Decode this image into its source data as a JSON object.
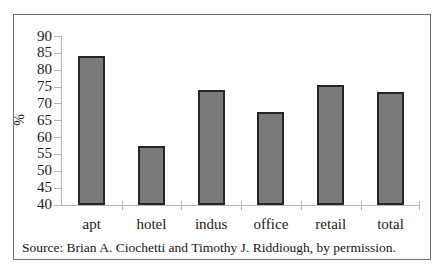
{
  "source": "Source: Brian A. Ciochetti and Timothy J. Riddiough, by permission.",
  "chart_data": {
    "type": "bar",
    "title": "",
    "xlabel": "",
    "ylabel": "%",
    "categories": [
      "apt",
      "hotel",
      "indus",
      "office",
      "retail",
      "total"
    ],
    "values": [
      84,
      57.5,
      74,
      67.5,
      75.5,
      73.5
    ],
    "ylim": [
      40,
      90
    ],
    "yticks": [
      40,
      45,
      50,
      55,
      60,
      65,
      70,
      75,
      80,
      85,
      90
    ],
    "grid": false,
    "legend": false,
    "colors": {
      "bar_fill": "#7a7a7a",
      "bar_border": "#262626",
      "axis": "#b5b5b5",
      "text": "#1a1a1a",
      "frame_border": "#6e6e6e"
    }
  }
}
